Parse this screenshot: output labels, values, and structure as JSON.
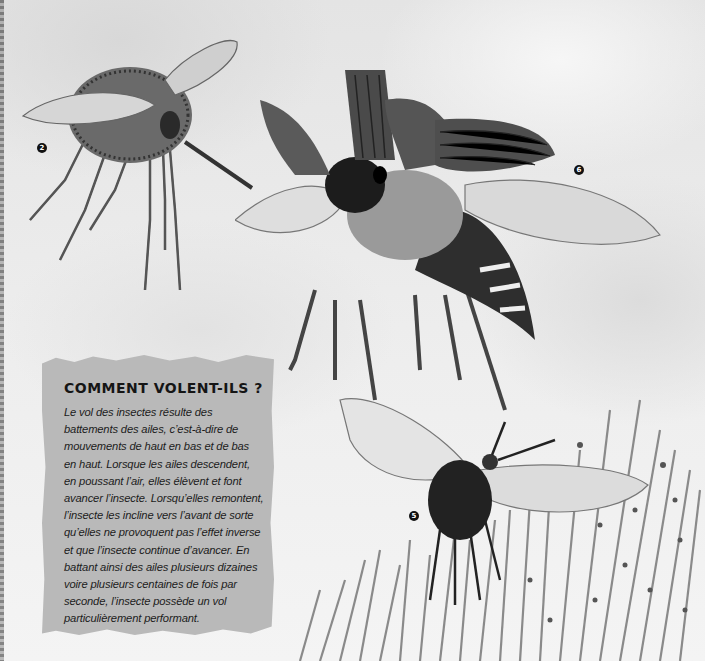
{
  "page": {
    "background_color": "#ececec",
    "style": "grayscale book illustration"
  },
  "illustrations": [
    {
      "id": "insect-2",
      "description": "hairy round-bodied fly with long proboscis and six long legs",
      "marker": "2"
    },
    {
      "id": "insect-6",
      "description": "beetle-like insect with ridged elytra raised and membranous wings spread, striped abdomen",
      "marker": "6"
    },
    {
      "id": "insect-5",
      "description": "dark fly with large transparent wings hovering above grass with swarming small insects",
      "marker": "5"
    }
  ],
  "markers": {
    "m2": "2",
    "m6": "6",
    "m5": "5"
  },
  "infobox": {
    "title": "COMMENT VOLENT-ILS ?",
    "body": "Le vol des insectes résulte des battements des ailes, c’est-à-dire de mouvements de haut en bas et de bas en haut. Lorsque les ailes descendent, en poussant l’air, elles élèvent et font avancer l’insecte. Lorsqu’elles remontent, l’insecte les incline vers l’avant de sorte qu’elles ne provoquent pas l’effet inverse et que l’insecte continue d’avancer. En battant ainsi des ailes plusieurs dizaines voire plusieurs centaines de fois par seconde, l’insecte possède un vol particulièrement performant.",
    "background_color": "#b9b9b9"
  }
}
